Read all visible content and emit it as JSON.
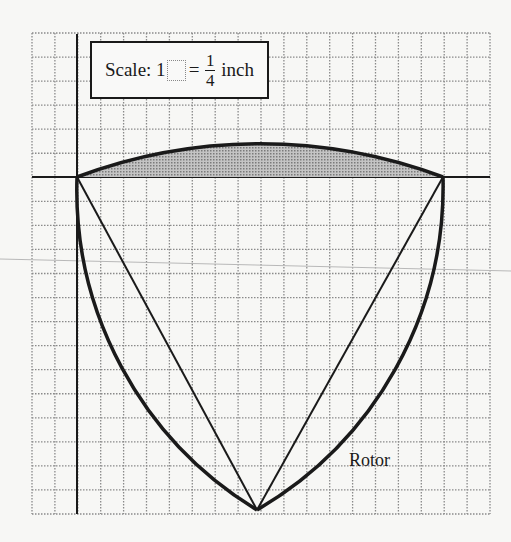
{
  "diagram": {
    "title": "Rotor",
    "grid": {
      "columns": 20,
      "rows": 20
    },
    "scale": {
      "prefix": "Scale: 1",
      "equals": "=",
      "numerator": "1",
      "denominator": "4",
      "unit": "inch"
    },
    "label": "Rotor",
    "colors": {
      "line": "#1a1a1a",
      "grid": "#8a8a8a",
      "shade": "#a9a9a9"
    }
  }
}
